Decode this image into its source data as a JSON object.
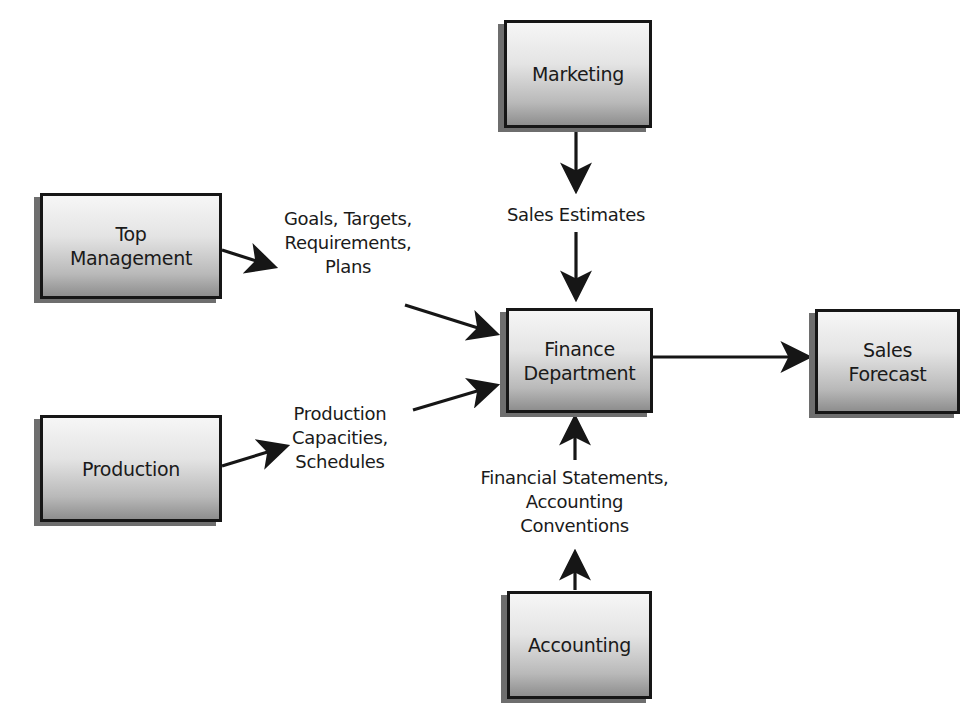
{
  "diagram": {
    "type": "flowchart",
    "nodes": {
      "marketing": {
        "label": "Marketing"
      },
      "top_management": {
        "label_line1": "Top",
        "label_line2": "Management"
      },
      "production": {
        "label": "Production"
      },
      "finance": {
        "label_line1": "Finance",
        "label_line2": "Department"
      },
      "sales_forecast": {
        "label_line1": "Sales",
        "label_line2": "Forecast"
      },
      "accounting": {
        "label": "Accounting"
      }
    },
    "edge_labels": {
      "sales_estimates": "Sales Estimates",
      "goals": {
        "line1": "Goals, Targets,",
        "line2": "Requirements,",
        "line3": "Plans"
      },
      "production_caps": {
        "line1": "Production",
        "line2": "Capacities,",
        "line3": "Schedules"
      },
      "financial": {
        "line1": "Financial Statements,",
        "line2": "Accounting",
        "line3": "Conventions"
      }
    },
    "edges": [
      {
        "from": "Marketing",
        "to": "Finance Department",
        "via": "Sales Estimates"
      },
      {
        "from": "Top Management",
        "to": "Finance Department",
        "via": "Goals, Targets, Requirements, Plans"
      },
      {
        "from": "Production",
        "to": "Finance Department",
        "via": "Production Capacities, Schedules"
      },
      {
        "from": "Accounting",
        "to": "Finance Department",
        "via": "Financial Statements, Accounting Conventions"
      },
      {
        "from": "Finance Department",
        "to": "Sales Forecast",
        "via": ""
      }
    ],
    "colors": {
      "border": "#161616",
      "shadow": "#6e6e6e",
      "gradient_top": "#f6f6f6",
      "gradient_bottom": "#8e8e8e",
      "text": "#1a1a1a",
      "background": "#ffffff"
    }
  }
}
